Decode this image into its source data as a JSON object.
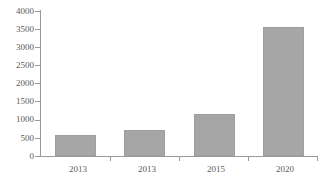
{
  "chart_data": {
    "type": "bar",
    "title": "",
    "subtitle": "",
    "xlabel": "",
    "ylabel": "",
    "categories": [
      "2013",
      "2013",
      "2015",
      "2020"
    ],
    "values": [
      570,
      720,
      1160,
      3560
    ],
    "series": [
      {
        "name": "",
        "values": [
          570,
          720,
          1160,
          3560
        ]
      }
    ],
    "ylim": [
      0,
      4000
    ],
    "ytick_labels": [
      "0",
      "500",
      "1000",
      "1500",
      "2000",
      "2500",
      "3000",
      "3500",
      "4000"
    ],
    "ytick_values": [
      0,
      500,
      1000,
      1500,
      2000,
      2500,
      3000,
      3500,
      4000
    ],
    "xtick_labels": [
      "2013",
      "2013",
      "2015",
      "2020"
    ],
    "grid": false,
    "legend": false,
    "legend_position": "none",
    "annotations": [],
    "colors": {
      "bar_fill": "#a6a6a6",
      "bar_edge": "#9e9e9e",
      "axis_line": "#9a9a9a",
      "tick_text": "#5a5a5a",
      "background": "#ffffff"
    }
  }
}
